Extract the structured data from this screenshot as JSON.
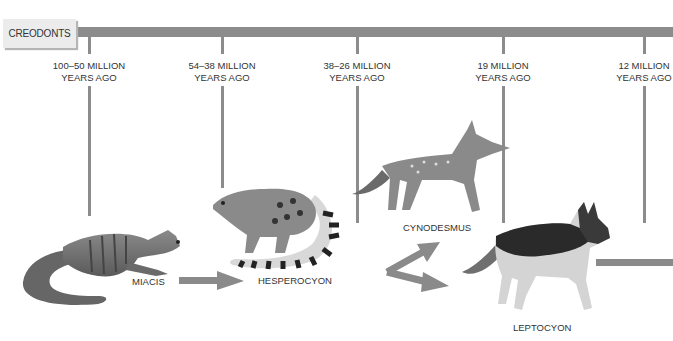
{
  "diagram": {
    "type": "evolutionary-timeline",
    "origin": {
      "label": "CREODONTS"
    },
    "bar_color": "#8c8c8c",
    "eras": [
      {
        "line1": "100–50 MILLION",
        "line2": "YEARS AGO"
      },
      {
        "line1": "54–38 MILLION",
        "line2": "YEARS AGO"
      },
      {
        "line1": "38–26 MILLION",
        "line2": "YEARS AGO"
      },
      {
        "line1": "19 MILLION",
        "line2": "YEARS AGO"
      },
      {
        "line1": "12 MILLION",
        "line2": "YEARS AGO"
      }
    ],
    "species": [
      {
        "name": "MIACIS",
        "icon": "miacis-illustration"
      },
      {
        "name": "HESPEROCYON",
        "icon": "hesperocyon-illustration"
      },
      {
        "name": "CYNODESMUS",
        "icon": "cynodesmus-illustration"
      },
      {
        "name": "LEPTOCYON",
        "icon": "leptocyon-illustration"
      }
    ],
    "arrows": [
      {
        "from": "MIACIS",
        "to": "HESPEROCYON"
      },
      {
        "from": "HESPEROCYON",
        "to": "CYNODESMUS"
      },
      {
        "from": "HESPEROCYON",
        "to": "LEPTOCYON"
      },
      {
        "from": "LEPTOCYON",
        "to": "continuation"
      }
    ]
  }
}
